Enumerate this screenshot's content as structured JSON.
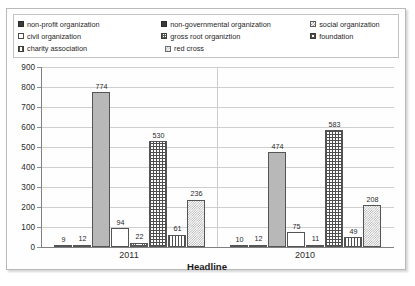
{
  "chart_data": {
    "type": "bar",
    "title": "",
    "xlabel": "Headline",
    "ylabel": "",
    "ylim": [
      0,
      900
    ],
    "ytick_step": 100,
    "yticks": [
      900,
      800,
      700,
      600,
      500,
      400,
      300,
      200,
      100,
      0
    ],
    "grid": true,
    "legend_position": "top",
    "categories": [
      "2011",
      "2010"
    ],
    "series": [
      {
        "name": "non-profit organization",
        "values": [
          9,
          10
        ],
        "pattern": "p-solid-dark"
      },
      {
        "name": "non-governmental organization",
        "values": [
          12,
          12
        ],
        "pattern": "p-solid-dark"
      },
      {
        "name": "social organization",
        "values": [
          774,
          474
        ],
        "pattern": "p-solid-gray"
      },
      {
        "name": "civil organization",
        "values": [
          94,
          75
        ],
        "pattern": "p-white"
      },
      {
        "name": "gross root organiztion",
        "values": [
          22,
          11
        ],
        "pattern": "p-grid-fine"
      },
      {
        "name": "foundation",
        "values": [
          530,
          583
        ],
        "pattern": "p-grid"
      },
      {
        "name": "charity association",
        "values": [
          61,
          49
        ],
        "pattern": "p-vstripe"
      },
      {
        "name": "red cross",
        "values": [
          236,
          208
        ],
        "pattern": "p-dots"
      }
    ]
  },
  "legend": {
    "rows": [
      [
        {
          "label": "non-profit organization",
          "pattern": "p-solid-dark",
          "swatch_name": "legend-swatch-non-profit-organization"
        },
        {
          "label": "non-governmental organization",
          "pattern": "p-solid-dark",
          "swatch_name": "legend-swatch-non-governmental-organization"
        },
        {
          "label": "social organization",
          "pattern": "p-check-lg",
          "swatch_name": "legend-swatch-social-organization"
        }
      ],
      [
        {
          "label": "civil organization",
          "pattern": "p-white",
          "swatch_name": "legend-swatch-civil-organization"
        },
        {
          "label": "gross root organiztion",
          "pattern": "p-grid-fine",
          "swatch_name": "legend-swatch-gross-root-organiztion"
        },
        {
          "label": "foundation",
          "pattern": "p-grid",
          "swatch_name": "legend-swatch-foundation"
        }
      ],
      [
        {
          "label": "charity association",
          "pattern": "p-vstripe",
          "swatch_name": "legend-swatch-charity-association"
        },
        {
          "label": "red cross",
          "pattern": "p-dots",
          "swatch_name": "legend-swatch-red-cross"
        }
      ]
    ]
  },
  "colors": {
    "plot_background": "#fefefe",
    "gridline": "#cfcfcf",
    "axis": "#808080",
    "text": "#2b2b2b",
    "bar_outline": "#555555",
    "solid_gray_fill": "#b8b8b8",
    "solid_dark_fill": "#3b3b3b"
  }
}
